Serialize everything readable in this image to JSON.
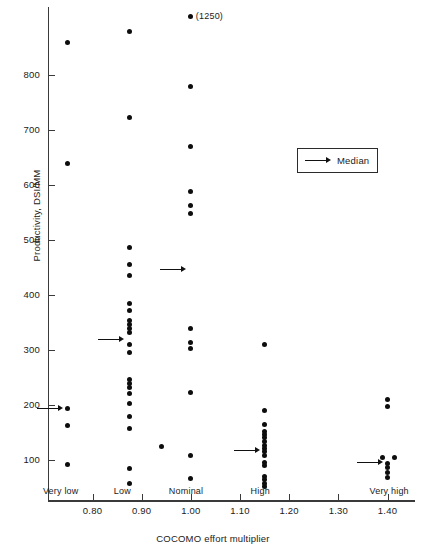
{
  "chart_data": {
    "type": "scatter",
    "title": "",
    "xlabel": "COCOMO effort multiplier",
    "ylabel": "Productivity, DSI/MM",
    "xlim": [
      0.72,
      1.45
    ],
    "ylim": [
      40,
      900
    ],
    "grid": false,
    "xticks": [
      "0.80",
      "0.90",
      "1.00",
      "1.10",
      "1.20",
      "1.30",
      "1.40"
    ],
    "xtick_values": [
      0.8,
      0.9,
      1.0,
      1.1,
      1.2,
      1.3,
      1.4
    ],
    "yticks": [
      "100",
      "200",
      "300",
      "400",
      "500",
      "600",
      "700",
      "800"
    ],
    "ytick_values": [
      100,
      200,
      300,
      400,
      500,
      600,
      700,
      800
    ],
    "category_labels": [
      {
        "label": "Very low",
        "x": 0.75
      },
      {
        "label": "Low",
        "x": 0.88
      },
      {
        "label": "Nominal",
        "x": 1.0
      },
      {
        "label": "High",
        "x": 1.15
      },
      {
        "label": "Very high",
        "x": 1.4
      }
    ],
    "legend": {
      "position": "upper right",
      "entries": [
        {
          "label": "Median",
          "marker": "arrow"
        }
      ]
    },
    "annotations": [
      {
        "text": "(1250)",
        "x": 1.0,
        "y": 900,
        "note": "off-scale point value"
      }
    ],
    "series": [
      {
        "name": "Very low",
        "x": 0.75,
        "values": [
          860,
          640,
          193,
          162,
          92
        ],
        "median": 193
      },
      {
        "name": "Low",
        "x": 0.88,
        "values": [
          880,
          722,
          487,
          455,
          435,
          385,
          372,
          353,
          345,
          340,
          333,
          310,
          295,
          245,
          238,
          233,
          222,
          202,
          180,
          157,
          85,
          58
        ],
        "median": 320
      },
      {
        "name": "Nominal",
        "x": 1.0,
        "values": [
          1250,
          780,
          670,
          588,
          563,
          548,
          340,
          313,
          303,
          223,
          108,
          67
        ],
        "median": 447,
        "extra_points": [
          {
            "x": 0.94,
            "y": 125
          }
        ]
      },
      {
        "name": "High",
        "x": 1.15,
        "values": [
          310,
          190,
          165,
          152,
          148,
          140,
          135,
          128,
          122,
          116,
          110,
          103,
          96,
          70,
          65,
          60,
          55
        ],
        "median": 118
      },
      {
        "name": "Very high",
        "x": 1.4,
        "values": [
          210,
          198,
          105,
          103,
          92,
          84,
          76,
          68
        ],
        "median": 95
      }
    ],
    "points": [
      {
        "x": 0.75,
        "y": 860
      },
      {
        "x": 0.75,
        "y": 640
      },
      {
        "x": 0.75,
        "y": 193
      },
      {
        "x": 0.75,
        "y": 162
      },
      {
        "x": 0.75,
        "y": 92
      },
      {
        "x": 0.875,
        "y": 880
      },
      {
        "x": 0.875,
        "y": 722
      },
      {
        "x": 0.875,
        "y": 487
      },
      {
        "x": 0.875,
        "y": 455
      },
      {
        "x": 0.875,
        "y": 435
      },
      {
        "x": 0.875,
        "y": 385
      },
      {
        "x": 0.875,
        "y": 372
      },
      {
        "x": 0.875,
        "y": 353
      },
      {
        "x": 0.875,
        "y": 346
      },
      {
        "x": 0.875,
        "y": 339
      },
      {
        "x": 0.875,
        "y": 332
      },
      {
        "x": 0.875,
        "y": 310
      },
      {
        "x": 0.875,
        "y": 295
      },
      {
        "x": 0.875,
        "y": 246
      },
      {
        "x": 0.875,
        "y": 239
      },
      {
        "x": 0.875,
        "y": 232
      },
      {
        "x": 0.875,
        "y": 221
      },
      {
        "x": 0.875,
        "y": 202
      },
      {
        "x": 0.875,
        "y": 180
      },
      {
        "x": 0.875,
        "y": 157
      },
      {
        "x": 0.875,
        "y": 85
      },
      {
        "x": 0.875,
        "y": 58
      },
      {
        "x": 1.0,
        "y": 1250
      },
      {
        "x": 1.0,
        "y": 780
      },
      {
        "x": 1.0,
        "y": 670
      },
      {
        "x": 1.0,
        "y": 588
      },
      {
        "x": 1.0,
        "y": 563
      },
      {
        "x": 1.0,
        "y": 548
      },
      {
        "x": 1.0,
        "y": 340
      },
      {
        "x": 1.0,
        "y": 313
      },
      {
        "x": 1.0,
        "y": 303
      },
      {
        "x": 1.0,
        "y": 223
      },
      {
        "x": 1.0,
        "y": 108
      },
      {
        "x": 1.0,
        "y": 67
      },
      {
        "x": 0.94,
        "y": 125
      },
      {
        "x": 1.15,
        "y": 310
      },
      {
        "x": 1.15,
        "y": 190
      },
      {
        "x": 1.15,
        "y": 165
      },
      {
        "x": 1.15,
        "y": 152
      },
      {
        "x": 1.15,
        "y": 147
      },
      {
        "x": 1.15,
        "y": 141
      },
      {
        "x": 1.15,
        "y": 133
      },
      {
        "x": 1.15,
        "y": 127
      },
      {
        "x": 1.15,
        "y": 121
      },
      {
        "x": 1.15,
        "y": 115
      },
      {
        "x": 1.15,
        "y": 108
      },
      {
        "x": 1.15,
        "y": 96
      },
      {
        "x": 1.15,
        "y": 90
      },
      {
        "x": 1.15,
        "y": 70
      },
      {
        "x": 1.15,
        "y": 64
      },
      {
        "x": 1.15,
        "y": 58
      },
      {
        "x": 1.15,
        "y": 52
      },
      {
        "x": 1.4,
        "y": 210
      },
      {
        "x": 1.4,
        "y": 198
      },
      {
        "x": 1.39,
        "y": 105
      },
      {
        "x": 1.415,
        "y": 105
      },
      {
        "x": 1.4,
        "y": 94
      },
      {
        "x": 1.4,
        "y": 86
      },
      {
        "x": 1.4,
        "y": 78
      },
      {
        "x": 1.4,
        "y": 68
      }
    ],
    "medians": [
      {
        "category": "Very low",
        "x": 0.75,
        "y": 193
      },
      {
        "category": "Low",
        "x": 0.875,
        "y": 320
      },
      {
        "category": "Nominal",
        "x": 1.0,
        "y": 447
      },
      {
        "category": "High",
        "x": 1.15,
        "y": 118
      },
      {
        "category": "Very high",
        "x": 1.4,
        "y": 95
      }
    ]
  }
}
